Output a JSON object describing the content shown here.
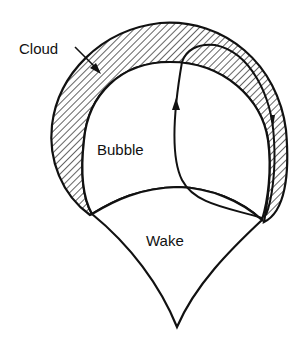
{
  "diagram": {
    "labels": {
      "cloud": "Cloud",
      "bubble": "Bubble",
      "wake": "Wake"
    },
    "colors": {
      "stroke": "#111111",
      "background": "#ffffff",
      "hatch": "#111111"
    },
    "regions": [
      {
        "name": "cloud",
        "fill": "hatched"
      },
      {
        "name": "bubble",
        "fill": "white"
      },
      {
        "name": "wake",
        "fill": "white"
      }
    ],
    "annotations": [
      {
        "type": "leader-arrow",
        "from": "cloud-label",
        "to": "cloud-region"
      },
      {
        "type": "streamline-arrow",
        "direction": "upward-in-bubble, downward-in-cloud"
      }
    ]
  }
}
